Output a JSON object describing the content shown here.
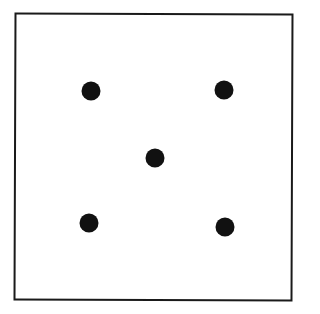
{
  "die": {
    "face_value": 5,
    "border_color": "#1a1a1a",
    "pip_color": "#111111",
    "pips": [
      {
        "name": "top-left",
        "x": 91,
        "y": 91
      },
      {
        "name": "top-right",
        "x": 224,
        "y": 90
      },
      {
        "name": "center",
        "x": 155,
        "y": 158
      },
      {
        "name": "bottom-left",
        "x": 89,
        "y": 223
      },
      {
        "name": "bottom-right",
        "x": 225,
        "y": 227
      }
    ]
  }
}
